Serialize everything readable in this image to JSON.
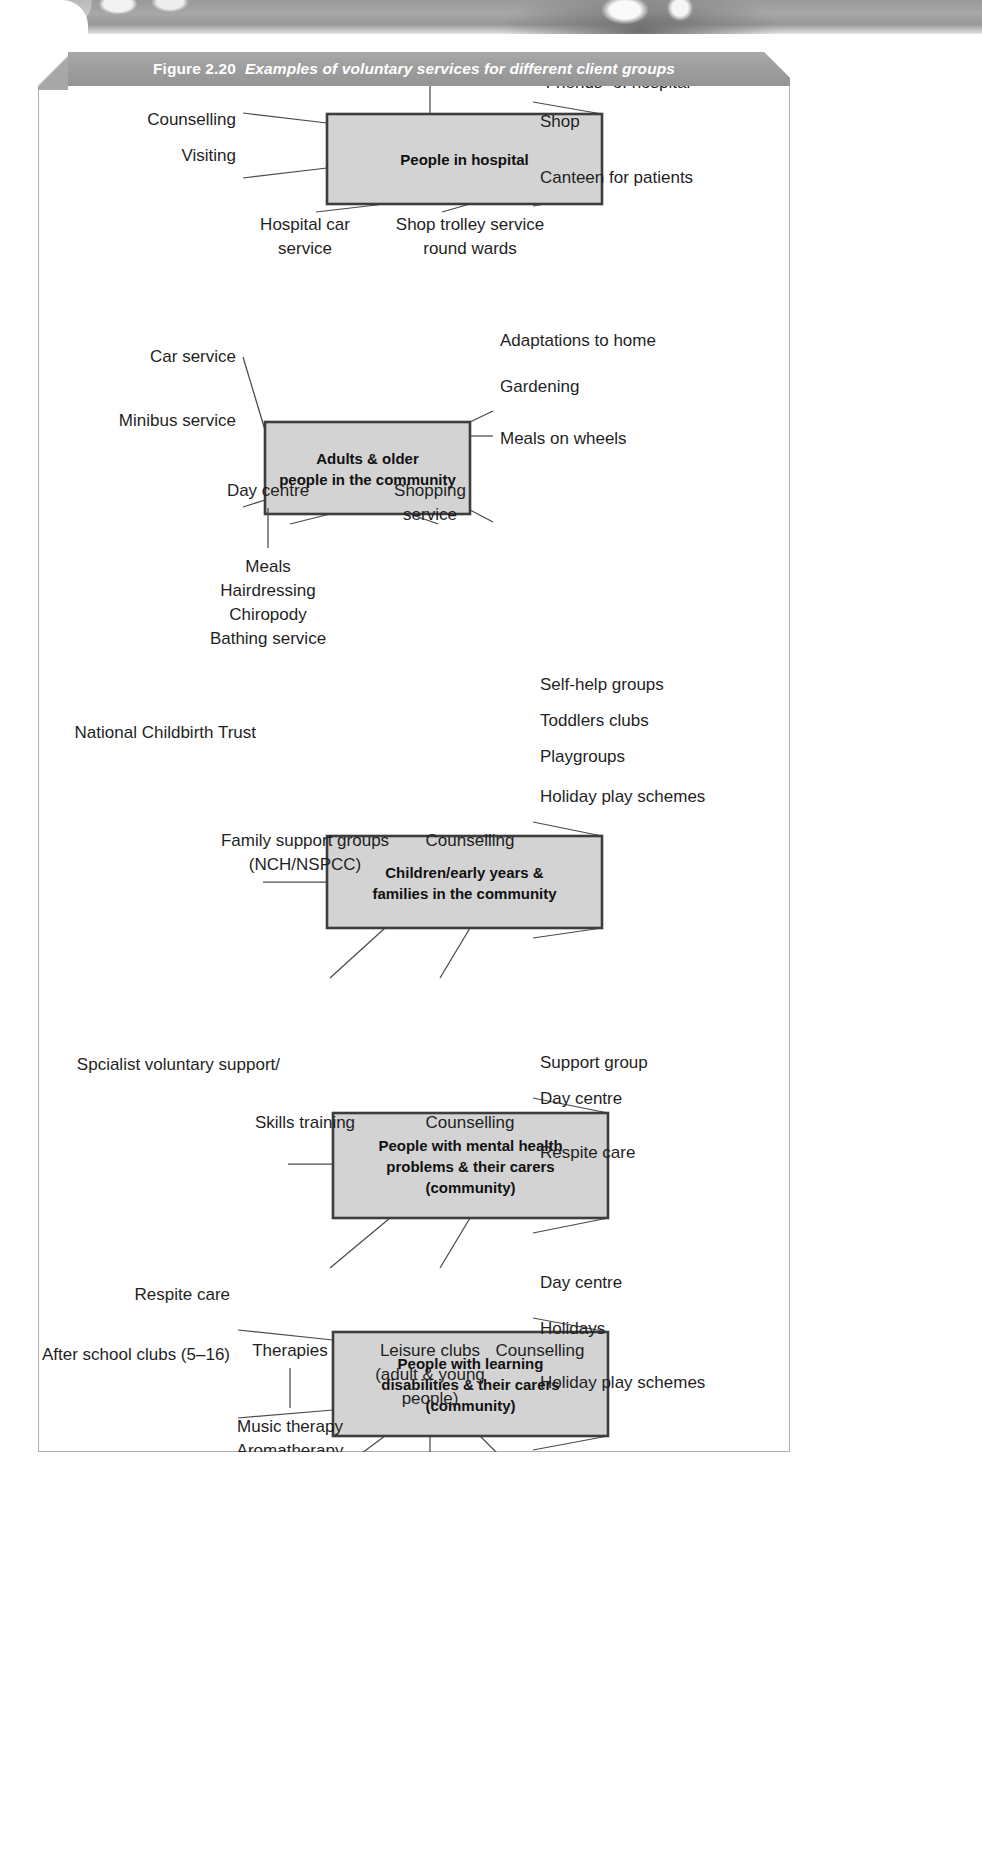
{
  "figure": {
    "number": "Figure 2.20",
    "caption": "Examples of voluntary services for different client groups",
    "banner_color": "#9d9d9d",
    "box_fill": "#d3d3d3",
    "box_stroke": "#3d3d3d"
  },
  "blocks": [
    {
      "id": "people-in-hospital",
      "title_lines": [
        "People in hospital"
      ],
      "left_labels": [
        "Counselling",
        "Visiting"
      ],
      "right_labels": [
        "“Friends” of hospital",
        "Shop",
        "Canteen for patients"
      ],
      "top_labels": [
        "Bereavement service"
      ],
      "bottom_labels": [
        {
          "lines": [
            "Hospital car",
            "service"
          ]
        },
        {
          "lines": [
            "Shop trolley service",
            "round wards"
          ]
        }
      ]
    },
    {
      "id": "adults-older-people",
      "title_lines": [
        "Adults & older",
        "people in the community"
      ],
      "left_labels": [
        "Car service",
        "Minibus service"
      ],
      "right_labels": [
        "Adaptations to home",
        "Gardening",
        "Meals on wheels"
      ],
      "top_labels": [],
      "bottom_labels": [
        {
          "lines": [
            "Day centre"
          ],
          "sub": [
            "Meals",
            "Hairdressing",
            "Chiropody",
            "Bathing service"
          ]
        },
        {
          "lines": [
            "Shopping",
            "service"
          ]
        }
      ]
    },
    {
      "id": "children-families",
      "title_lines": [
        "Children/early years &",
        "families in the community"
      ],
      "left_labels": [
        "National Childbirth Trust"
      ],
      "right_labels": [
        "Self-help groups",
        "Toddlers clubs",
        "Playgroups",
        "Holiday play schemes"
      ],
      "top_labels": [],
      "bottom_labels": [
        {
          "lines": [
            "Family support groups",
            "(NCH/NSPCC)"
          ]
        },
        {
          "lines": [
            "Counselling"
          ]
        }
      ]
    },
    {
      "id": "mental-health",
      "title_lines": [
        "People with mental health",
        "problems & their carers",
        "(community)"
      ],
      "left_labels": [
        "Spcialist voluntary support/",
        "information (MIND)"
      ],
      "right_labels": [
        "Support group",
        "Day centre",
        "Respite care"
      ],
      "top_labels": [],
      "bottom_labels": [
        {
          "lines": [
            "Skills training"
          ]
        },
        {
          "lines": [
            "Counselling"
          ]
        }
      ]
    },
    {
      "id": "learning-disabilities",
      "title_lines": [
        "People with learning",
        "disabilities & their carers",
        "(community)"
      ],
      "left_labels": [
        "Respite care",
        "After school clubs (5–16)"
      ],
      "right_labels": [
        "Day centre",
        "Holidays",
        "Holiday play schemes"
      ],
      "top_labels": [],
      "bottom_labels": [
        {
          "lines": [
            "Therapies"
          ],
          "sub": [
            "Music therapy",
            "Aromatherapy"
          ]
        },
        {
          "lines": [
            "Leisure clubs",
            "(adult & young",
            "people)"
          ]
        },
        {
          "lines": [
            "Counselling"
          ]
        }
      ]
    }
  ]
}
